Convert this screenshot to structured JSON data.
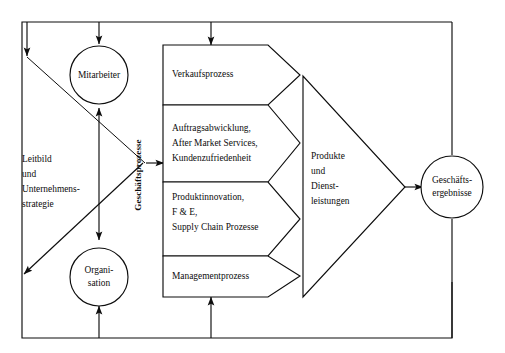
{
  "diagram": {
    "strokeColor": "#0d0d0d",
    "backgroundColor": "#ffffff",
    "nodes": {
      "mitarbeiter": {
        "label": "Mitarbeiter",
        "shape": "circle"
      },
      "organisation": {
        "label_line1": "Organi-",
        "label_line2": "sation",
        "shape": "circle"
      },
      "geschaeftsergebnisse": {
        "label_line1": "Geschäfts-",
        "label_line2": "ergebnisse",
        "shape": "circle"
      }
    },
    "strategy_block": {
      "line1": "Leitbild",
      "line2": "und",
      "line3": "Unternehmens-",
      "line4": "strategie",
      "shape": "left-chevron"
    },
    "vertical_label": "Geschäftsprozesse",
    "process_boxes": [
      {
        "id": "verkaufsprozess",
        "lines": [
          "Verkaufsprozess"
        ]
      },
      {
        "id": "auftragsabwicklung",
        "lines": [
          "Auftragsabwicklung,",
          "After Market Services,",
          "Kundenzufriedenheit"
        ]
      },
      {
        "id": "produktinnovation",
        "lines": [
          "Produktinnovation,",
          "F & E,",
          "Supply Chain Prozesse"
        ]
      },
      {
        "id": "managementprozess",
        "lines": [
          "Managementprozess"
        ]
      }
    ],
    "output_block": {
      "id": "produkte-dienstleistungen",
      "lines": [
        "Produkte",
        "und",
        "Dienst-",
        "leistungen"
      ],
      "shape": "right-triangle"
    }
  }
}
